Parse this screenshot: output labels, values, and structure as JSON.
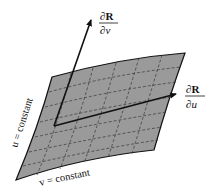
{
  "diagram": {
    "labels": {
      "dRdv_num": "∂R",
      "dRdv_den": "∂v",
      "dRdu_num": "∂R",
      "dRdu_den": "∂u",
      "u_constant": "u = constant",
      "v_constant": "v = constant"
    },
    "colors": {
      "surface_fill": "#9a9a9a",
      "surface_edge": "#111111",
      "grid_dash": "#333333",
      "arrow": "#111111"
    }
  }
}
